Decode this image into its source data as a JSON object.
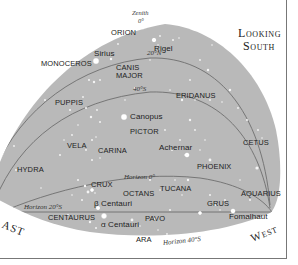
{
  "title": {
    "line1": "Looking",
    "line2": "South"
  },
  "zenith": {
    "label": "Zenith",
    "mark": "0°"
  },
  "directions": {
    "east": "East",
    "west": "West",
    "east_visible": "AST"
  },
  "latitude_arcs": [
    {
      "label": "20°N"
    },
    {
      "label": "40°S"
    },
    {
      "label": "Horizon 0°"
    },
    {
      "label": "Horizon 20°S"
    },
    {
      "label": "Horizon 40°S"
    }
  ],
  "constellations": [
    "ORION",
    "MONOCEROS",
    "CANIS MAJOR",
    "ERIDANUS",
    "PUPPIS",
    "PICTOR",
    "VELA",
    "CARINA",
    "CETUS",
    "PHOENIX",
    "HYDRA",
    "CRUX",
    "OCTANS",
    "TUCANA",
    "AQUARIUS",
    "GRUS",
    "CENTAURUS",
    "PAVO",
    "ARA"
  ],
  "stars": [
    "Sirius",
    "Rigel",
    "Canopus",
    "Achernar",
    "β Centauri",
    "α Centauri",
    "Fomalhaut"
  ],
  "colors": {
    "sky": "#b9b9b9",
    "background": "#ffffff",
    "arc_line": "#6e6e6e",
    "star": "#ffffff",
    "text": "#222222"
  },
  "labels": {
    "orion": "ORION",
    "monoceros": "MONOCEROS",
    "canis_major_1": "CANIS",
    "canis_major_2": "MAJOR",
    "eridanus": "ERIDANUS",
    "puppis": "PUPPIS",
    "pictor": "PICTOR",
    "vela": "VELA",
    "carina": "CARINA",
    "cetus": "CETUS",
    "phoenix": "PHOENIX",
    "hydra": "HYDRA",
    "crux": "CRUX",
    "octans": "OCTANS",
    "tucana": "TUCANA",
    "aquarius": "AQUARIUS",
    "grus": "GRUS",
    "centaurus": "CENTAURUS",
    "pavo": "PAVO",
    "ara": "ARA",
    "sirius": "Sirius",
    "rigel": "Rigel",
    "canopus": "Canopus",
    "achernar": "Achernar",
    "beta_centauri": "β Centauri",
    "alpha_centauri": "α Centauri",
    "fomalhaut": "Fomalhaut",
    "arc_20n": "20°N",
    "arc_40s": "40°S",
    "horizon_0": "Horizon 0°",
    "horizon_20s": "Horizon 20°S",
    "horizon_40s": "Horizon 40°S"
  }
}
